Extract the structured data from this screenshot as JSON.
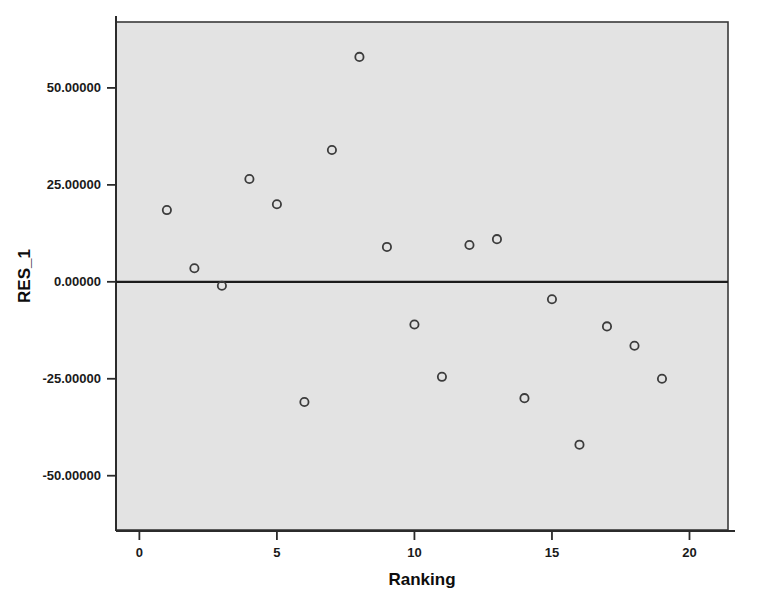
{
  "chart_data": {
    "type": "scatter",
    "title": "",
    "xlabel": "Ranking",
    "ylabel": "RES_1",
    "xlim": [
      -0.85,
      21.4
    ],
    "ylim": [
      -64.0,
      67.0
    ],
    "xticks": [
      0,
      5,
      10,
      15,
      20
    ],
    "xtick_labels": [
      "0",
      "5",
      "10",
      "15",
      "20"
    ],
    "yticks": [
      50,
      25,
      0,
      -25,
      -50
    ],
    "ytick_labels": [
      "50.00000",
      "25.00000",
      "0.00000",
      "-25.00000",
      "-50.00000"
    ],
    "grid": false,
    "legend": null,
    "reference_line": {
      "axis": "y",
      "value": 0
    },
    "marker": {
      "shape": "circle-open",
      "size": 6,
      "color": "#3c3c3c"
    },
    "background_color": "#e3e3e3",
    "x": [
      1,
      2,
      3,
      4,
      5,
      6,
      7,
      8,
      9,
      10,
      11,
      12,
      13,
      14,
      15,
      16,
      17,
      18,
      19
    ],
    "y": [
      18.5,
      3.5,
      -1.0,
      26.5,
      20.0,
      -31.0,
      34.0,
      58.0,
      9.0,
      -11.0,
      -24.5,
      9.5,
      11.0,
      -30.0,
      -4.5,
      -42.0,
      -11.5,
      -16.5,
      -25.0
    ],
    "points": [
      {
        "x": 1,
        "y": 18.5
      },
      {
        "x": 2,
        "y": 3.5
      },
      {
        "x": 3,
        "y": -1.0
      },
      {
        "x": 4,
        "y": 26.5
      },
      {
        "x": 5,
        "y": 20.0
      },
      {
        "x": 6,
        "y": -31.0
      },
      {
        "x": 7,
        "y": 34.0
      },
      {
        "x": 8,
        "y": 58.0
      },
      {
        "x": 9,
        "y": 9.0
      },
      {
        "x": 10,
        "y": -11.0
      },
      {
        "x": 11,
        "y": -24.5
      },
      {
        "x": 12,
        "y": 9.5
      },
      {
        "x": 13,
        "y": 11.0
      },
      {
        "x": 14,
        "y": -30.0
      },
      {
        "x": 15,
        "y": -4.5
      },
      {
        "x": 16,
        "y": -42.0
      },
      {
        "x": 17,
        "y": -11.5
      },
      {
        "x": 18,
        "y": -16.5
      },
      {
        "x": 19,
        "y": -25.0
      }
    ]
  }
}
